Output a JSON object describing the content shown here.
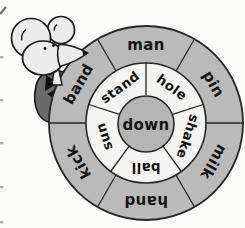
{
  "wheel": {
    "hub_word": "down",
    "inner_words": [
      "stand",
      "hole",
      "shake",
      "ball",
      "sun"
    ],
    "outer_words": [
      "man",
      "pin",
      "milk",
      "hand",
      "kick",
      "band"
    ],
    "colors": {
      "outer_ring_fill": "#bababa",
      "inner_ring_fill": "#f4f4f2",
      "hub_fill": "#b5b5b5",
      "outline": "#262626",
      "text": "#141414"
    }
  },
  "mouse": {
    "skin_color": "#ececec",
    "vest_color": "#6a6a6a",
    "accent_color": "#141414"
  }
}
